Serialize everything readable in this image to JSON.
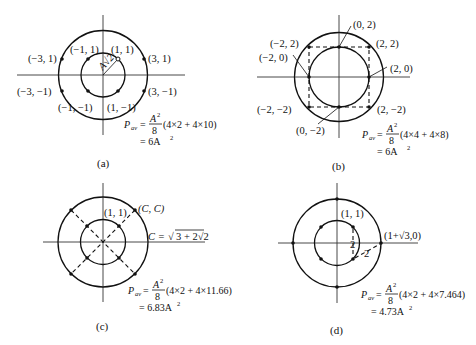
{
  "figure": {
    "panels": [
      {
        "id": "a",
        "caption": "(a)",
        "points_inner": [
          "(−1, 1)",
          "(1, 1)",
          "(−1, −1)",
          "(1, −1)"
        ],
        "points_outer": [
          "(−3, 1)",
          "(3, 1)",
          "(−3, −1)",
          "(3, −1)"
        ],
        "radius_label": "A√2",
        "formula_lhs": "P",
        "formula_sub": "av",
        "formula_frac_num": "A",
        "formula_frac_den": "8",
        "formula_rhs": "(4×2 + 4×10)",
        "result": "= 6A",
        "result_sup": "2"
      },
      {
        "id": "b",
        "caption": "(b)",
        "points": [
          "(0, 2)",
          "(−2, 2)",
          "(2, 2)",
          "(−2, 0)",
          "(2, 0)",
          "(−2, −2)",
          "(2, −2)",
          "(0, −2)"
        ],
        "formula_lhs": "P",
        "formula_sub": "av",
        "formula_frac_num": "A",
        "formula_frac_den": "8",
        "formula_rhs": "(4×4 + 4×8)",
        "result": "= 6A",
        "result_sup": "2"
      },
      {
        "id": "c",
        "caption": "(c)",
        "points": [
          "(1, 1)",
          "(C, C)"
        ],
        "constant_lhs": "C = ",
        "constant_rhs": "3 + 2√2",
        "formula_lhs": "P",
        "formula_sub": "av",
        "formula_frac_num": "A",
        "formula_frac_den": "8",
        "formula_rhs": "(4×2 + 4×11.66)",
        "result": "= 6.83A",
        "result_sup": "2"
      },
      {
        "id": "d",
        "caption": "(d)",
        "points": [
          "(1, 1)",
          "(1+√3,0)"
        ],
        "distance_labels": [
          "2",
          "2"
        ],
        "formula_lhs": "P",
        "formula_sub": "av",
        "formula_frac_num": "A",
        "formula_frac_den": "8",
        "formula_rhs": "(4×2 + 4×7.464)",
        "result": "= 4.73A",
        "result_sup": "2"
      }
    ]
  }
}
